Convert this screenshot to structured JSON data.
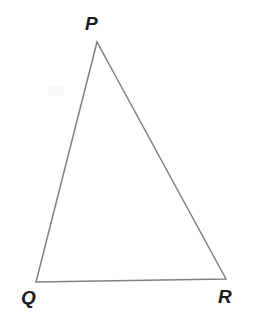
{
  "figure": {
    "kind": "geometry-diagram",
    "shape": "triangle",
    "background_color": "#ffffff",
    "stroke_color": "#808080",
    "stroke_width": 1.5,
    "label_color": "#1c1c1c"
  },
  "labels": {
    "apex": "P",
    "bottom_left": "Q",
    "bottom_right": "R"
  },
  "chart_data": {
    "type": "scatter",
    "title": "",
    "xlabel": "",
    "ylabel": "",
    "grid": false,
    "legend": "none",
    "xlim": [
      0,
      260
    ],
    "ylim": [
      316,
      0
    ],
    "categories": [
      "P",
      "Q",
      "R"
    ],
    "points": [
      {
        "label": "P",
        "x": 97,
        "y": 42
      },
      {
        "label": "Q",
        "x": 36,
        "y": 282
      },
      {
        "label": "R",
        "x": 226,
        "y": 279
      }
    ],
    "edges": [
      {
        "from": "P",
        "to": "Q"
      },
      {
        "from": "Q",
        "to": "R"
      },
      {
        "from": "R",
        "to": "P"
      }
    ],
    "polygon_points": "97,42 36,282 226,279",
    "annotations": [
      {
        "text": "P",
        "x": 95,
        "y": 26
      },
      {
        "text": "Q",
        "x": 28,
        "y": 301
      },
      {
        "text": "R",
        "x": 225,
        "y": 300
      }
    ]
  }
}
